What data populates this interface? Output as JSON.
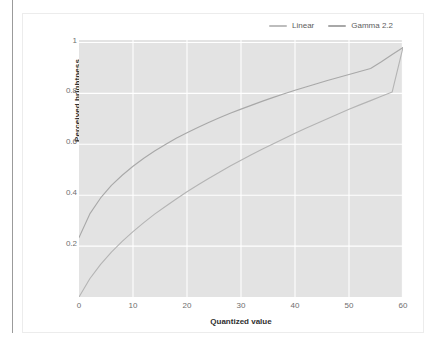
{
  "page": {
    "background_color": "#ffffff",
    "card_border_color": "#ececec",
    "left_rule_color": "#9b9b9b"
  },
  "legend": {
    "position": "top-right",
    "items": [
      {
        "label": "Linear",
        "color": "#bdbdbd",
        "swatch_icon": "line-swatch-icon"
      },
      {
        "label": "Gamma 2.2",
        "color": "#a8a8a8",
        "swatch_icon": "line-swatch-icon"
      }
    ]
  },
  "axes": {
    "xlabel": "Quantized value",
    "ylabel": "Perceived brightness",
    "xticks": [
      "0",
      "10",
      "20",
      "30",
      "40",
      "50",
      "60"
    ],
    "yticks": [
      "0.2",
      "0.4",
      "0.6",
      "0.8",
      "1"
    ]
  },
  "chart_data": {
    "type": "line",
    "title": "",
    "xlabel": "Quantized value",
    "ylabel": "Perceived brightness",
    "xlim": [
      0,
      60
    ],
    "ylim": [
      0,
      1.03
    ],
    "grid": true,
    "legend_position": "top-right",
    "plot_background": "#e3e3e3",
    "gridline_color": "#ffffff",
    "x": [
      0,
      2,
      4,
      6,
      8,
      10,
      12,
      14,
      16,
      18,
      20,
      22,
      24,
      26,
      28,
      30,
      32,
      34,
      36,
      38,
      40,
      42,
      44,
      46,
      48,
      50,
      52,
      54,
      56,
      58,
      60
    ],
    "series": [
      {
        "name": "Linear",
        "color": "#b4b4b4",
        "values": [
          0.0,
          0.073,
          0.131,
          0.18,
          0.223,
          0.262,
          0.298,
          0.332,
          0.363,
          0.393,
          0.422,
          0.449,
          0.475,
          0.5,
          0.525,
          0.548,
          0.571,
          0.593,
          0.614,
          0.635,
          0.656,
          0.676,
          0.695,
          0.714,
          0.733,
          0.752,
          0.77,
          0.787,
          0.805,
          0.822,
          1.0
        ]
      },
      {
        "name": "Gamma 2.2",
        "color": "#a8a8a8",
        "values": [
          0.238,
          0.333,
          0.397,
          0.447,
          0.488,
          0.524,
          0.556,
          0.585,
          0.611,
          0.636,
          0.658,
          0.679,
          0.699,
          0.718,
          0.736,
          0.753,
          0.769,
          0.785,
          0.8,
          0.815,
          0.829,
          0.842,
          0.855,
          0.868,
          0.88,
          0.892,
          0.904,
          0.916,
          0.943,
          0.972,
          1.0
        ]
      }
    ]
  }
}
